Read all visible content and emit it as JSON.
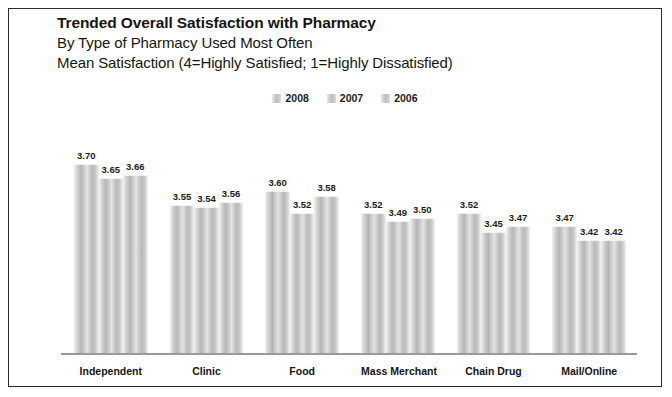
{
  "title": {
    "main": "Trended Overall Satisfaction with Pharmacy",
    "line2": "By Type of Pharmacy Used Most Often",
    "line3": "Mean Satisfaction (4=Highly Satisfied; 1=Highly Dissatisfied)"
  },
  "legend": {
    "items": [
      {
        "label": "2008"
      },
      {
        "label": "2007"
      },
      {
        "label": "2006"
      }
    ]
  },
  "chart_data": {
    "type": "bar",
    "title": "Trended Overall Satisfaction with Pharmacy",
    "subtitle": "By Type of Pharmacy Used Most Often",
    "annotation": "Mean Satisfaction (4=Highly Satisfied; 1=Highly Dissatisfied)",
    "xlabel": "",
    "ylabel": "Mean Satisfaction",
    "ylim": [
      3.0,
      3.8
    ],
    "grid": false,
    "legend_position": "top-center",
    "categories": [
      "Independent",
      "Clinic",
      "Food",
      "Mass Merchant",
      "Chain Drug",
      "Mail/Online"
    ],
    "series": [
      {
        "name": "2008",
        "values": [
          3.7,
          3.55,
          3.6,
          3.52,
          3.52,
          3.47
        ]
      },
      {
        "name": "2007",
        "values": [
          3.65,
          3.54,
          3.52,
          3.49,
          3.45,
          3.42
        ]
      },
      {
        "name": "2006",
        "values": [
          3.66,
          3.56,
          3.58,
          3.5,
          3.47,
          3.42
        ]
      }
    ],
    "value_labels": [
      [
        "3.70",
        "3.65",
        "3.66"
      ],
      [
        "3.55",
        "3.54",
        "3.56"
      ],
      [
        "3.60",
        "3.52",
        "3.58"
      ],
      [
        "3.52",
        "3.49",
        "3.50"
      ],
      [
        "3.52",
        "3.45",
        "3.47"
      ],
      [
        "3.47",
        "3.42",
        "3.42"
      ]
    ]
  }
}
